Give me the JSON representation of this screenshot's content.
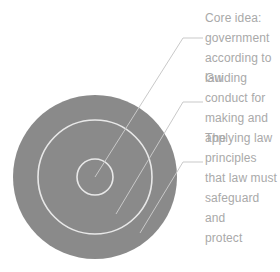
{
  "diagram": {
    "type": "concentric-circles",
    "background_color": "#ffffff",
    "disc_fill_color": "#8a8a8a",
    "ring_stroke_color": "#e8e8e8",
    "leader_line_color": "#c9c9c9",
    "text_color": "#a9a9a9",
    "center": {
      "x": 95,
      "y": 177
    },
    "rings": [
      {
        "name": "outer-ring",
        "radius": 82,
        "label_key": "principles",
        "label": "The principles that law must safeguard and protect"
      },
      {
        "name": "middle-ring",
        "radius": 57,
        "label_key": "guiding",
        "label": "Guiding conduct for making and applying law"
      },
      {
        "name": "inner-circle",
        "radius": 18,
        "label_key": "core",
        "label": "Core idea: government according to law"
      }
    ],
    "callouts": [
      {
        "key": "core",
        "text": "Core idea:\ngovernment\naccording to\nlaw",
        "target_ring": "inner-circle"
      },
      {
        "key": "guiding",
        "text": "Guiding\nconduct for\nmaking and\napplying law",
        "target_ring": "middle-ring"
      },
      {
        "key": "principles",
        "text": "The principles\nthat law must\nsafeguard and\nprotect",
        "target_ring": "outer-ring"
      }
    ]
  }
}
